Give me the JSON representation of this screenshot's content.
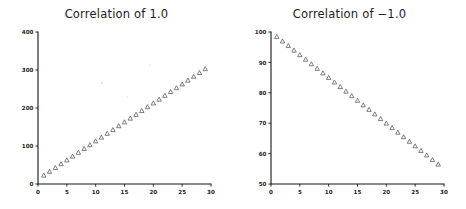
{
  "figure": {
    "background": "#ffffff",
    "width": 466,
    "height": 209,
    "marker_color": "#4a4a4a",
    "axis_color": "#141414"
  },
  "chart_data": [
    {
      "type": "scatter",
      "title": "Correlation of 1.0",
      "xlabel": "",
      "ylabel": "",
      "xlim": [
        0,
        30
      ],
      "ylim": [
        0,
        400
      ],
      "xticks": [
        0,
        5,
        10,
        15,
        20,
        25,
        30
      ],
      "yticks": [
        0,
        100,
        200,
        300,
        400
      ],
      "xticklabels": [
        "0",
        "5",
        "10",
        "15",
        "20",
        "25",
        "30"
      ],
      "yticklabels": [
        "0",
        "100",
        "200",
        "300",
        "400"
      ],
      "grid": false,
      "legend": false,
      "marker": "triangle-up-open",
      "series": [
        {
          "name": "perfect positive",
          "x": [
            1,
            2,
            3,
            4,
            5,
            6,
            7,
            8,
            9,
            10,
            11,
            12,
            13,
            14,
            15,
            16,
            17,
            18,
            19,
            20,
            21,
            22,
            23,
            24,
            25,
            26,
            27,
            28,
            29
          ],
          "y": [
            23,
            33,
            43,
            53,
            63,
            73,
            83,
            93,
            103,
            113,
            123,
            133,
            143,
            153,
            163,
            173,
            183,
            193,
            203,
            213,
            223,
            233,
            243,
            253,
            263,
            273,
            283,
            293,
            303
          ]
        }
      ]
    },
    {
      "type": "scatter",
      "title": "Correlation of −1.0",
      "xlabel": "",
      "ylabel": "",
      "xlim": [
        0,
        30
      ],
      "ylim": [
        50,
        100
      ],
      "xticks": [
        0,
        5,
        10,
        15,
        20,
        25,
        30
      ],
      "yticks": [
        50,
        60,
        70,
        80,
        90,
        100
      ],
      "xticklabels": [
        "0",
        "5",
        "10",
        "15",
        "20",
        "25",
        "30"
      ],
      "yticklabels": [
        "50",
        "60",
        "70",
        "80",
        "90",
        "100"
      ],
      "grid": false,
      "legend": false,
      "marker": "triangle-up-open",
      "series": [
        {
          "name": "perfect negative",
          "x": [
            1,
            2,
            3,
            4,
            5,
            6,
            7,
            8,
            9,
            10,
            11,
            12,
            13,
            14,
            15,
            16,
            17,
            18,
            19,
            20,
            21,
            22,
            23,
            24,
            25,
            26,
            27,
            28,
            29
          ],
          "y": [
            98.5,
            97.0,
            95.5,
            94.0,
            92.5,
            91.0,
            89.5,
            88.0,
            86.5,
            85.0,
            83.5,
            82.0,
            80.5,
            79.0,
            77.5,
            76.0,
            74.5,
            73.0,
            71.5,
            70.0,
            68.5,
            67.0,
            65.5,
            64.0,
            62.5,
            61.0,
            59.5,
            58.0,
            56.5
          ]
        }
      ]
    }
  ]
}
